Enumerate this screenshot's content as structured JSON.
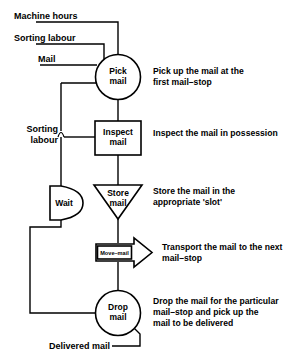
{
  "diagram": {
    "colors": {
      "background": "#ffffff",
      "stroke": "#000000",
      "text": "#000000"
    },
    "inputs": [
      {
        "id": "machine-hours",
        "label": "Machine hours"
      },
      {
        "id": "sorting-labour-top",
        "label": "Sorting labour"
      },
      {
        "id": "mail",
        "label": "Mail"
      },
      {
        "id": "sorting-labour-mid-line1",
        "label": "Sorting"
      },
      {
        "id": "sorting-labour-mid-line2",
        "label": "labour"
      }
    ],
    "outputs": [
      {
        "id": "delivered-mail",
        "label": "Delivered mail"
      }
    ],
    "nodes": [
      {
        "id": "pick-mail",
        "shape": "circle",
        "line1": "Pick",
        "line2": "mail",
        "description_line1": "Pick up the mail at the",
        "description_line2": "first mail–stop",
        "description_line3": ""
      },
      {
        "id": "inspect-mail",
        "shape": "rectangle",
        "line1": "Inspect",
        "line2": "mail",
        "description_line1": "Inspect the mail in possession",
        "description_line2": "",
        "description_line3": ""
      },
      {
        "id": "store-mail",
        "shape": "triangle-down",
        "line1": "Store",
        "line2": "mail",
        "description_line1": "Store the mail in  the",
        "description_line2": "appropriate 'slot'",
        "description_line3": ""
      },
      {
        "id": "move-mail",
        "shape": "arrow-right",
        "line1": "Move–mail",
        "line2": "",
        "description_line1": "Transport the mail to the next",
        "description_line2": "mail–stop",
        "description_line3": ""
      },
      {
        "id": "drop-mail",
        "shape": "circle",
        "line1": "Drop",
        "line2": "mail",
        "description_line1": "Drop the mail for the particular",
        "description_line2": "mail–stop and pick up the",
        "description_line3": "mail to be delivered"
      },
      {
        "id": "wait",
        "shape": "d-shape",
        "line1": "Wait",
        "line2": "",
        "description_line1": "",
        "description_line2": "",
        "description_line3": ""
      }
    ]
  }
}
